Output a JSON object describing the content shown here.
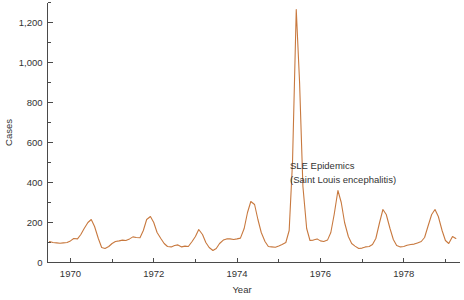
{
  "chart_data": {
    "type": "line",
    "title": "",
    "xlabel": "Year",
    "ylabel": "Cases",
    "xlim": [
      1969.45,
      1979.35
    ],
    "ylim": [
      0,
      1300
    ],
    "grid": false,
    "legend_position": "none",
    "line_color": "#c8793f",
    "axis_color": "#4a4a4a",
    "background_color": "#ffffff",
    "y_ticks_major": [
      0,
      200,
      400,
      600,
      800,
      1000,
      1200
    ],
    "y_ticklabels": [
      "0",
      "200",
      "400",
      "600",
      "800",
      "1,000",
      "1,200"
    ],
    "y_ticks_minor": [
      100,
      300,
      500,
      700,
      900,
      1100,
      1300
    ],
    "x_ticks_major": [
      1970,
      1972,
      1974,
      1976,
      1978
    ],
    "x_ticklabels": [
      "1970",
      "1972",
      "1974",
      "1976",
      "1978"
    ],
    "x_ticks_minor": [
      1971,
      1973,
      1975,
      1977,
      1979
    ],
    "series": [
      {
        "name": "SLE cases",
        "x": [
          1969.5,
          1969.58,
          1969.67,
          1969.75,
          1969.83,
          1969.92,
          1970.0,
          1970.08,
          1970.17,
          1970.25,
          1970.33,
          1970.42,
          1970.5,
          1970.58,
          1970.67,
          1970.75,
          1970.83,
          1970.92,
          1971.0,
          1971.08,
          1971.17,
          1971.25,
          1971.33,
          1971.42,
          1971.5,
          1971.58,
          1971.67,
          1971.75,
          1971.83,
          1971.92,
          1972.0,
          1972.08,
          1972.17,
          1972.25,
          1972.33,
          1972.42,
          1972.5,
          1972.58,
          1972.67,
          1972.75,
          1972.83,
          1972.92,
          1973.0,
          1973.08,
          1973.17,
          1973.25,
          1973.33,
          1973.42,
          1973.5,
          1973.58,
          1973.67,
          1973.75,
          1973.83,
          1973.92,
          1974.0,
          1974.08,
          1974.17,
          1974.25,
          1974.33,
          1974.42,
          1974.5,
          1974.58,
          1974.67,
          1974.75,
          1974.83,
          1974.92,
          1975.0,
          1975.08,
          1975.17,
          1975.25,
          1975.33,
          1975.42,
          1975.5,
          1975.58,
          1975.67,
          1975.75,
          1975.83,
          1975.92,
          1976.0,
          1976.08,
          1976.17,
          1976.25,
          1976.33,
          1976.42,
          1976.5,
          1976.58,
          1976.67,
          1976.75,
          1976.83,
          1976.92,
          1977.0,
          1977.08,
          1977.17,
          1977.25,
          1977.33,
          1977.42,
          1977.5,
          1977.58,
          1977.67,
          1977.75,
          1977.83,
          1977.92,
          1978.0,
          1978.08,
          1978.17,
          1978.25,
          1978.33,
          1978.42,
          1978.5,
          1978.58,
          1978.67,
          1978.75,
          1978.83,
          1978.92,
          1979.0,
          1979.08,
          1979.17,
          1979.25
        ],
        "y": [
          105,
          100,
          98,
          96,
          98,
          100,
          108,
          120,
          118,
          140,
          170,
          200,
          215,
          180,
          120,
          75,
          70,
          80,
          95,
          105,
          108,
          112,
          110,
          118,
          128,
          125,
          124,
          160,
          215,
          230,
          200,
          150,
          120,
          95,
          80,
          78,
          85,
          88,
          78,
          82,
          80,
          105,
          130,
          165,
          140,
          100,
          75,
          60,
          70,
          95,
          112,
          118,
          118,
          115,
          118,
          122,
          170,
          250,
          305,
          290,
          215,
          150,
          105,
          80,
          78,
          76,
          82,
          90,
          100,
          160,
          500,
          1265,
          900,
          380,
          170,
          110,
          112,
          118,
          108,
          105,
          112,
          150,
          240,
          360,
          300,
          200,
          130,
          95,
          82,
          70,
          72,
          78,
          80,
          90,
          120,
          200,
          265,
          240,
          170,
          115,
          85,
          78,
          80,
          86,
          90,
          92,
          98,
          105,
          125,
          180,
          240,
          265,
          230,
          160,
          110,
          95,
          130,
          120
        ]
      }
    ],
    "annotations": [
      {
        "id": "sle-epidemics",
        "lines": [
          "SLE Epidemics",
          "(Saint Louis encephalitis)"
        ],
        "x_px": 290,
        "y_px": 169
      }
    ]
  },
  "labels": {
    "y_axis_title": "Cases",
    "x_axis_title": "Year",
    "annotation_line1": "SLE Epidemics",
    "annotation_line2": "(Saint Louis encephalitis)"
  }
}
